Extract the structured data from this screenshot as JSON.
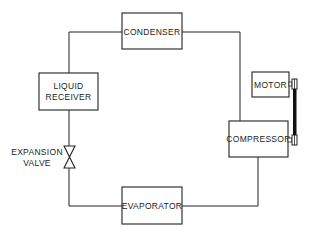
{
  "diagram": {
    "components": {
      "condenser": "CONDENSER",
      "liquid_receiver_line1": "LIQUID",
      "liquid_receiver_line2": "RECEIVER",
      "expansion_valve_line1": "EXPANSION",
      "expansion_valve_line2": "VALVE",
      "evaporator": "EVAPORATOR",
      "compressor": "COMPRESSOR",
      "motor": "MOTOR"
    },
    "connections": [
      {
        "from": "compressor",
        "to": "condenser"
      },
      {
        "from": "condenser",
        "to": "liquid_receiver"
      },
      {
        "from": "liquid_receiver",
        "to": "expansion_valve"
      },
      {
        "from": "expansion_valve",
        "to": "evaporator"
      },
      {
        "from": "evaporator",
        "to": "compressor"
      },
      {
        "from": "motor",
        "to": "compressor",
        "type": "belt"
      }
    ],
    "colors": {
      "line": "#222222",
      "background": "#ffffff"
    }
  }
}
